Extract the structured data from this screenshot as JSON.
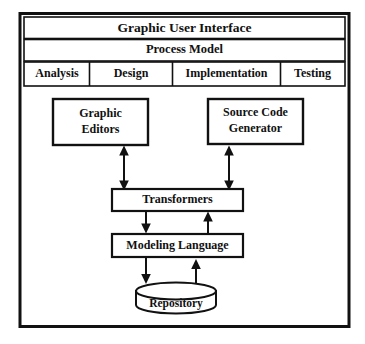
{
  "diagram": {
    "title_bar": {
      "label": "Graphic User Interface"
    },
    "subtitle_bar": {
      "label": "Process Model"
    },
    "phase_tabs": [
      {
        "label": "Analysis"
      },
      {
        "label": "Design"
      },
      {
        "label": "Implementation"
      },
      {
        "label": "Testing"
      }
    ],
    "components": {
      "graphic_editors": "Graphic Editors",
      "graphic_editors_line1": "Graphic",
      "graphic_editors_line2": "Editors",
      "source_code_generator": "Source Code Generator",
      "source_code_generator_line1": "Source Code",
      "source_code_generator_line2": "Generator",
      "transformers": "Transformers",
      "modeling_language": "Modeling Language",
      "repository": "Repository"
    },
    "connections": [
      {
        "from": "Graphic Editors",
        "to": "Transformers",
        "type": "bidirectional"
      },
      {
        "from": "Source Code Generator",
        "to": "Transformers",
        "type": "bidirectional"
      },
      {
        "from": "Transformers",
        "to": "Modeling Language",
        "type": "down"
      },
      {
        "from": "Modeling Language",
        "to": "Transformers",
        "type": "up"
      },
      {
        "from": "Modeling Language",
        "to": "Repository",
        "type": "down"
      },
      {
        "from": "Repository",
        "to": "Modeling Language",
        "type": "up"
      }
    ],
    "colors": {
      "stroke": "#111111",
      "background": "#ffffff"
    }
  }
}
